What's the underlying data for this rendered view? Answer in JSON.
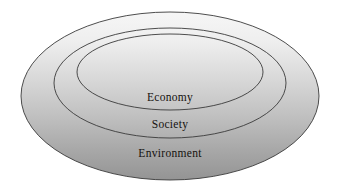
{
  "diagram": {
    "type": "concentric-ellipses",
    "background_color": "#ffffff",
    "fill": {
      "gradient_start_color": "#f4f4f4",
      "gradient_end_color": "#989898",
      "direction": "top-to-bottom"
    },
    "outline_color": "#3a3a3a",
    "label_color": "#15120f",
    "rings": [
      {
        "id": "environment",
        "label": "Environment",
        "level": 1,
        "position": "outermost",
        "label_x": 170,
        "label_y": 156,
        "cx": 170,
        "cy": 96,
        "rx": 149,
        "ry": 84
      },
      {
        "id": "society",
        "label": "Society",
        "level": 2,
        "position": "middle",
        "label_x": 170,
        "label_y": 128,
        "cx": 170,
        "cy": 83,
        "rx": 116,
        "ry": 55
      },
      {
        "id": "economy",
        "label": "Economy",
        "level": 3,
        "position": "innermost",
        "label_x": 170,
        "label_y": 101,
        "cx": 170,
        "cy": 72,
        "rx": 93,
        "ry": 38
      }
    ]
  }
}
